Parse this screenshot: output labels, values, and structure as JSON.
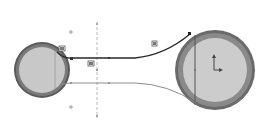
{
  "view": {
    "type": "cad-sketch",
    "background": "#ffffff"
  },
  "colors": {
    "ring_outer": "#5a5a5a",
    "ring_mid": "#8a8a8a",
    "disc_fill": "#c8c8c8",
    "belt_upper": "#2a2a2a",
    "belt_lower": "#8c8c8c",
    "construction": "#b8b8b8",
    "point": "#9a9a9a",
    "badge": "#707070",
    "origin": "#555555"
  },
  "small_pulley": {
    "cx": 42,
    "cy": 70,
    "r_outer": 28,
    "r_inner": 23
  },
  "large_pulley": {
    "cx": 215,
    "cy": 70,
    "r_outer": 40,
    "r_inner": 32
  },
  "construction_line": {
    "x": 97,
    "y1": 22,
    "y2": 118
  },
  "points": [
    {
      "name": "top-sketch-point",
      "x": 71,
      "y": 32
    },
    {
      "name": "bottom-sketch-point",
      "x": 71,
      "y": 107
    },
    {
      "name": "center-sketch-point",
      "x": 97,
      "y": 70
    }
  ],
  "relation_badges": [
    {
      "name": "tangent-relation-badge-left",
      "x": 59,
      "y": 46
    },
    {
      "name": "coincident-relation-badge",
      "x": 88,
      "y": 61
    },
    {
      "name": "tangent-relation-badge-right",
      "x": 152,
      "y": 41
    }
  ],
  "origin": {
    "x": 214,
    "y": 70
  }
}
